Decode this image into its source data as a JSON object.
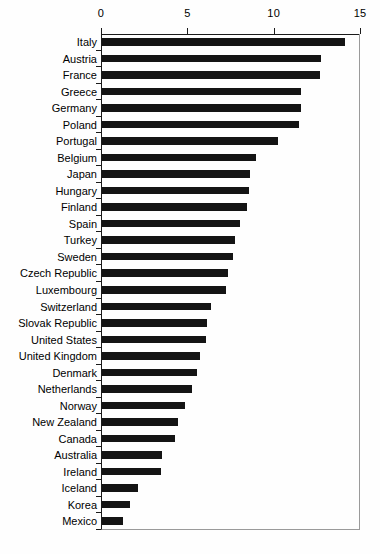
{
  "chart_data": {
    "type": "bar",
    "orientation": "horizontal",
    "title": "",
    "subtitle": "",
    "xlabel": "",
    "ylabel": "",
    "xlim": [
      0,
      15
    ],
    "ylim": null,
    "grid": false,
    "legend": null,
    "legend_position": "none",
    "bar_color": "#141414",
    "axis_color": "#1a1a1a",
    "x_ticks": [
      {
        "label": "0",
        "value": 0
      },
      {
        "label": "5",
        "value": 5
      },
      {
        "label": "10",
        "value": 10
      },
      {
        "label": "15",
        "value": 15
      }
    ],
    "categories": [
      "Italy",
      "Austria",
      "France",
      "Greece",
      "Germany",
      "Poland",
      "Portugal",
      "Belgium",
      "Japan",
      "Hungary",
      "Finland",
      "Spain",
      "Turkey",
      "Sweden",
      "Czech Republic",
      "Luxembourg",
      "Switzerland",
      "Slovak Republic",
      "United States",
      "United Kingdom",
      "Denmark",
      "Netherlands",
      "Norway",
      "New Zealand",
      "Canada",
      "Australia",
      "Ireland",
      "Iceland",
      "Korea",
      "Mexico"
    ],
    "values": [
      14.1,
      12.7,
      12.6,
      11.5,
      11.5,
      11.4,
      10.2,
      8.9,
      8.6,
      8.5,
      8.4,
      8.0,
      7.7,
      7.6,
      7.3,
      7.2,
      6.3,
      6.1,
      6.0,
      5.7,
      5.5,
      5.2,
      4.8,
      4.4,
      4.2,
      3.5,
      3.4,
      2.1,
      1.6,
      1.2
    ]
  }
}
